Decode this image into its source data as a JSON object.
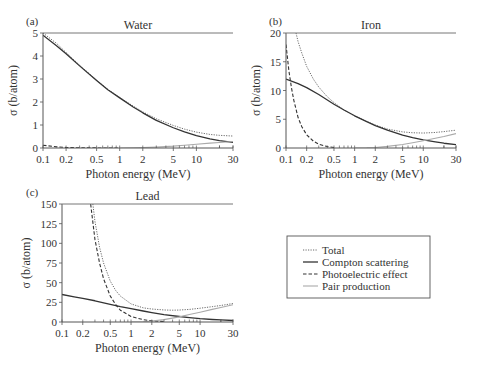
{
  "colors": {
    "axis": "#555555",
    "total": "#333333",
    "compton": "#333333",
    "photo": "#333333",
    "pair": "#aaaaaa",
    "text": "#333333"
  },
  "legend": {
    "items": [
      {
        "key": "total",
        "label": "Total",
        "style": "dotted"
      },
      {
        "key": "compton",
        "label": "Compton scattering",
        "style": "solid"
      },
      {
        "key": "photo",
        "label": "Photoelectric effect",
        "style": "dashed"
      },
      {
        "key": "pair",
        "label": "Pair production",
        "style": "solid-light"
      }
    ]
  },
  "chart_data": [
    {
      "id": "a",
      "type": "line",
      "panel_label": "(a)",
      "title": "Water",
      "xlabel": "Photon energy (MeV)",
      "ylabel": "σ (b/atom)",
      "xscale": "log",
      "xlim": [
        0.1,
        30
      ],
      "ylim": [
        0,
        5
      ],
      "xticks": [
        0.1,
        0.2,
        0.5,
        1,
        2,
        5,
        10,
        30
      ],
      "xtick_labels": [
        "0.1",
        "0.2",
        "0.5",
        "1",
        "2",
        "5",
        "10",
        "30"
      ],
      "yticks": [
        0,
        1,
        2,
        3,
        4,
        5
      ],
      "ytick_labels": [
        "0",
        "1",
        "2",
        "3",
        "4",
        "5"
      ],
      "box": {
        "x0": 43,
        "y0": 33,
        "x1": 233,
        "y1": 148
      },
      "series": [
        {
          "name": "Total",
          "key": "total",
          "x": [
            0.1,
            0.15,
            0.2,
            0.3,
            0.5,
            0.7,
            1,
            1.5,
            2,
            3,
            5,
            7,
            10,
            15,
            20,
            30
          ],
          "y": [
            5.0,
            4.55,
            4.15,
            3.6,
            2.95,
            2.55,
            2.2,
            1.82,
            1.57,
            1.27,
            0.98,
            0.82,
            0.69,
            0.59,
            0.55,
            0.52
          ]
        },
        {
          "name": "Compton scattering",
          "key": "compton",
          "x": [
            0.1,
            0.15,
            0.2,
            0.3,
            0.5,
            0.7,
            1,
            1.5,
            2,
            3,
            5,
            7,
            10,
            15,
            20,
            30
          ],
          "y": [
            4.9,
            4.45,
            4.1,
            3.57,
            2.93,
            2.53,
            2.18,
            1.78,
            1.53,
            1.2,
            0.88,
            0.7,
            0.54,
            0.4,
            0.32,
            0.24
          ]
        },
        {
          "name": "Photoelectric effect",
          "key": "photo",
          "x": [
            0.1,
            0.15,
            0.2,
            0.3,
            0.5,
            0.7,
            1
          ],
          "y": [
            0.12,
            0.05,
            0.025,
            0.01,
            0.003,
            0.001,
            0.0
          ]
        },
        {
          "name": "Pair production",
          "key": "pair",
          "x": [
            1.02,
            1.5,
            2,
            3,
            5,
            7,
            10,
            15,
            20,
            30
          ],
          "y": [
            0.0,
            0.005,
            0.015,
            0.04,
            0.08,
            0.12,
            0.16,
            0.21,
            0.24,
            0.28
          ]
        }
      ]
    },
    {
      "id": "b",
      "type": "line",
      "panel_label": "(b)",
      "title": "Iron",
      "xlabel": "Photon energy (MeV)",
      "ylabel": "σ (b/atom)",
      "xscale": "log",
      "xlim": [
        0.1,
        30
      ],
      "ylim": [
        0,
        20
      ],
      "xticks": [
        0.1,
        0.2,
        0.5,
        1,
        2,
        5,
        10,
        30
      ],
      "xtick_labels": [
        "0.1",
        "0.2",
        "0.5",
        "1",
        "2",
        "5",
        "10",
        "30"
      ],
      "yticks": [
        0,
        5,
        10,
        15,
        20
      ],
      "ytick_labels": [
        "0",
        "5",
        "10",
        "15",
        "20"
      ],
      "box": {
        "x0": 286,
        "y0": 33,
        "x1": 456,
        "y1": 148
      },
      "series": [
        {
          "name": "Total",
          "key": "total",
          "x": [
            0.14,
            0.15,
            0.17,
            0.2,
            0.25,
            0.3,
            0.4,
            0.5,
            0.7,
            1,
            1.5,
            2,
            3,
            5,
            7,
            10,
            15,
            20,
            30
          ],
          "y": [
            20,
            18.5,
            16.5,
            14.2,
            12.0,
            10.6,
            8.9,
            7.9,
            6.6,
            5.6,
            4.6,
            4.0,
            3.3,
            2.8,
            2.65,
            2.6,
            2.7,
            2.85,
            3.1
          ]
        },
        {
          "name": "Compton scattering",
          "key": "compton",
          "x": [
            0.1,
            0.15,
            0.2,
            0.3,
            0.5,
            0.7,
            1,
            1.5,
            2,
            3,
            5,
            7,
            10,
            15,
            20,
            30
          ],
          "y": [
            12.0,
            11.2,
            10.5,
            9.3,
            7.6,
            6.6,
            5.6,
            4.6,
            3.9,
            3.1,
            2.25,
            1.8,
            1.4,
            1.05,
            0.83,
            0.6
          ]
        },
        {
          "name": "Photoelectric effect",
          "key": "photo",
          "x": [
            0.1,
            0.11,
            0.12,
            0.13,
            0.15,
            0.17,
            0.2,
            0.25,
            0.3,
            0.4,
            0.5
          ],
          "y": [
            18.0,
            13.5,
            10.5,
            8.3,
            5.3,
            3.7,
            2.3,
            1.2,
            0.65,
            0.25,
            0.1
          ]
        },
        {
          "name": "Pair production",
          "key": "pair",
          "x": [
            1.02,
            1.5,
            2,
            3,
            5,
            7,
            10,
            15,
            20,
            30
          ],
          "y": [
            0.0,
            0.03,
            0.1,
            0.28,
            0.6,
            0.9,
            1.25,
            1.7,
            2.0,
            2.5
          ]
        }
      ]
    },
    {
      "id": "c",
      "type": "line",
      "panel_label": "(c)",
      "title": "Lead",
      "xlabel": "Photon energy (MeV)",
      "ylabel": "σ (b/atom)",
      "xscale": "log",
      "xlim": [
        0.1,
        30
      ],
      "ylim": [
        0,
        150
      ],
      "xticks": [
        0.1,
        0.2,
        0.5,
        1,
        2,
        5,
        10,
        30
      ],
      "xtick_labels": [
        "0.1",
        "0.2",
        "0.5",
        "1",
        "2",
        "5",
        "10",
        "30"
      ],
      "yticks": [
        0,
        25,
        50,
        75,
        100,
        125,
        150
      ],
      "ytick_labels": [
        "0",
        "25",
        "50",
        "75",
        "100",
        "125",
        "150"
      ],
      "box": {
        "x0": 62,
        "y0": 204,
        "x1": 233,
        "y1": 322
      },
      "series": [
        {
          "name": "Total",
          "key": "total",
          "x": [
            0.28,
            0.3,
            0.35,
            0.4,
            0.5,
            0.6,
            0.7,
            1,
            1.5,
            2,
            3,
            4,
            5,
            7,
            10,
            15,
            20,
            30
          ],
          "y": [
            150,
            128,
            95,
            75,
            52,
            40,
            33,
            23,
            18,
            16.5,
            15.3,
            15.0,
            15.2,
            16.0,
            17.5,
            19.5,
            21.0,
            23.5
          ]
        },
        {
          "name": "Compton scattering",
          "key": "compton",
          "x": [
            0.1,
            0.15,
            0.2,
            0.3,
            0.5,
            0.7,
            1,
            1.5,
            2,
            3,
            5,
            7,
            10,
            15,
            20,
            30
          ],
          "y": [
            35,
            32,
            30,
            27,
            22.5,
            19.5,
            17,
            14,
            12,
            9.5,
            7,
            5.6,
            4.3,
            3.2,
            2.6,
            1.9
          ]
        },
        {
          "name": "Photoelectric effect",
          "key": "photo",
          "x": [
            0.26,
            0.3,
            0.35,
            0.4,
            0.5,
            0.6,
            0.7,
            1,
            1.5,
            2,
            3
          ],
          "y": [
            150,
            105,
            75,
            55,
            33,
            22,
            15,
            7,
            3,
            1.5,
            0.5
          ]
        },
        {
          "name": "Pair production",
          "key": "pair",
          "x": [
            1.02,
            1.5,
            2,
            3,
            5,
            7,
            10,
            15,
            20,
            30
          ],
          "y": [
            0.0,
            0.4,
            1.2,
            3.0,
            6.5,
            9.5,
            12.5,
            16,
            18.5,
            22
          ]
        }
      ]
    }
  ]
}
